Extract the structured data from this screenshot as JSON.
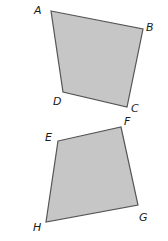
{
  "figure": {
    "fill": "#c6c6c6",
    "stroke": "#555555",
    "shapes": [
      {
        "name": "ABCD",
        "points": "51,11 143,29 127,107 63,92",
        "labels": [
          {
            "text": "A",
            "x": 34,
            "y": 14
          },
          {
            "text": "B",
            "x": 146,
            "y": 31
          },
          {
            "text": "C",
            "x": 131,
            "y": 112
          },
          {
            "text": "D",
            "x": 53,
            "y": 105
          }
        ]
      },
      {
        "name": "EFGH",
        "points": "58,141 121,127 138,205 46,222",
        "labels": [
          {
            "text": "E",
            "x": 45,
            "y": 141
          },
          {
            "text": "F",
            "x": 124,
            "y": 125
          },
          {
            "text": "G",
            "x": 139,
            "y": 221
          },
          {
            "text": "H",
            "x": 33,
            "y": 231
          }
        ]
      }
    ]
  }
}
